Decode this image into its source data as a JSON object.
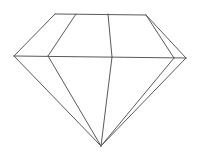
{
  "figure": {
    "title": "",
    "stroke_color": "#5a5a5a",
    "background": "#ffffff",
    "vertices": {
      "table_left": [
        55,
        14
      ],
      "table_inner_left": [
        76,
        14
      ],
      "table_mid": [
        108,
        14
      ],
      "table_right": [
        146,
        15
      ],
      "girdle_left": [
        14,
        56
      ],
      "girdle_inner_left": [
        48,
        56
      ],
      "girdle_mid": [
        112,
        57
      ],
      "girdle_inner_right": [
        174,
        58
      ],
      "girdle_right": [
        186,
        58
      ],
      "culet": [
        101,
        146
      ]
    },
    "edges": [
      [
        "table_left",
        "table_right"
      ],
      [
        "table_left",
        "girdle_left"
      ],
      [
        "table_inner_left",
        "girdle_inner_left"
      ],
      [
        "table_mid",
        "girdle_mid"
      ],
      [
        "table_right",
        "girdle_inner_right"
      ],
      [
        "table_right",
        "girdle_right"
      ],
      [
        "girdle_left",
        "girdle_right"
      ],
      [
        "girdle_left",
        "culet"
      ],
      [
        "girdle_inner_left",
        "culet"
      ],
      [
        "girdle_mid",
        "culet"
      ],
      [
        "girdle_inner_right",
        "culet"
      ],
      [
        "girdle_right",
        "culet"
      ]
    ]
  }
}
